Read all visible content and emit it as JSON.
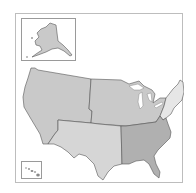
{
  "map": {
    "type": "regional-map",
    "subject": "United States regions",
    "regions": [
      {
        "id": "west",
        "name": "West",
        "fill": "#c9c9c9"
      },
      {
        "id": "midwest",
        "name": "Midwest",
        "fill": "#c9c9c9"
      },
      {
        "id": "southwest",
        "name": "Southwest",
        "fill": "#d6d6d6"
      },
      {
        "id": "southeast",
        "name": "Southeast",
        "fill": "#b0b0b0"
      },
      {
        "id": "northeast",
        "name": "Northeast",
        "fill": "#e6e6e6"
      }
    ],
    "insets": [
      {
        "id": "alaska",
        "name": "Alaska",
        "fill": "#c9c9c9"
      },
      {
        "id": "hawaii",
        "name": "Hawaii",
        "fill": "#b0b0b0"
      }
    ],
    "colors": {
      "background": "#ffffff",
      "frame_border": "#bdbdbd",
      "boundary_stroke": "#555555",
      "water": "#ffffff"
    }
  }
}
